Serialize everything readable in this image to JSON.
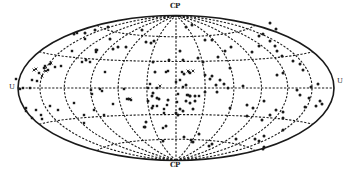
{
  "figure": {
    "projection": "Aitoff / Hammer equal-area all-sky projection",
    "labels": {
      "top": "CP",
      "bottom": "CP",
      "left": "U",
      "right": "U"
    },
    "geometry": {
      "cx": 176,
      "cy": 88,
      "rx": 158,
      "ry": 72.5
    },
    "colors": {
      "background": "#ffffff",
      "ink": "#1a1a1a"
    },
    "graticule": {
      "meridians_deg": [
        -150,
        -120,
        -90,
        -60,
        -30,
        0,
        30,
        60,
        90,
        120,
        150
      ],
      "parallels_deg": [
        -60,
        -30,
        0,
        30,
        60
      ],
      "style": "dashed"
    },
    "markers": {
      "dots": [
        [
          108,
          27
        ],
        [
          113,
          49
        ],
        [
          118,
          47
        ],
        [
          142,
          30
        ],
        [
          146,
          42
        ],
        [
          151,
          43
        ],
        [
          154,
          41
        ],
        [
          186,
          27
        ],
        [
          192,
          25
        ],
        [
          205,
          40
        ],
        [
          212,
          40
        ],
        [
          225,
          51
        ],
        [
          231,
          47
        ],
        [
          252,
          52
        ],
        [
          259,
          46
        ],
        [
          270,
          41
        ],
        [
          275,
          46
        ],
        [
          277,
          51
        ],
        [
          282,
          56
        ],
        [
          293,
          61
        ],
        [
          300,
          64
        ],
        [
          303,
          70
        ],
        [
          277,
          75
        ],
        [
          283,
          73
        ],
        [
          155,
          72
        ],
        [
          184,
          74
        ],
        [
          205,
          75
        ],
        [
          210,
          79
        ],
        [
          212,
          76
        ],
        [
          220,
          80
        ],
        [
          228,
          88
        ],
        [
          243,
          86
        ],
        [
          297,
          90
        ],
        [
          311,
          87
        ],
        [
          318,
          84
        ],
        [
          300,
          95
        ],
        [
          309,
          98
        ],
        [
          320,
          101
        ],
        [
          316,
          106
        ],
        [
          322,
          104
        ],
        [
          264,
          101
        ],
        [
          276,
          110
        ],
        [
          283,
          112
        ],
        [
          305,
          107
        ],
        [
          230,
          108
        ],
        [
          247,
          105
        ],
        [
          253,
          108
        ],
        [
          262,
          120
        ],
        [
          247,
          116
        ],
        [
          270,
          115
        ],
        [
          283,
          118
        ],
        [
          186,
          101
        ],
        [
          190,
          103
        ],
        [
          195,
          101
        ],
        [
          180,
          109
        ],
        [
          183,
          111
        ],
        [
          176,
          113
        ],
        [
          178,
          115
        ],
        [
          193,
          109
        ],
        [
          166,
          126
        ],
        [
          152,
          108
        ],
        [
          159,
          99
        ],
        [
          148,
          101
        ],
        [
          152,
          96
        ],
        [
          157,
          98
        ],
        [
          146,
          122
        ],
        [
          145,
          127
        ],
        [
          163,
          141
        ],
        [
          184,
          137
        ],
        [
          191,
          140
        ],
        [
          193,
          142
        ],
        [
          199,
          134
        ],
        [
          209,
          146
        ],
        [
          212,
          144
        ],
        [
          236,
          139
        ],
        [
          255,
          139
        ],
        [
          259,
          141
        ],
        [
          264,
          136
        ],
        [
          283,
          130
        ],
        [
          264,
          147
        ],
        [
          263,
          149
        ],
        [
          180,
          51
        ],
        [
          198,
          58
        ],
        [
          218,
          57
        ],
        [
          230,
          68
        ],
        [
          216,
          85
        ],
        [
          224,
          84
        ],
        [
          153,
          62
        ],
        [
          186,
          85
        ],
        [
          205,
          92
        ],
        [
          217,
          92
        ],
        [
          110,
          39
        ],
        [
          74,
          34
        ],
        [
          85,
          33
        ],
        [
          96,
          50
        ],
        [
          126,
          47
        ],
        [
          153,
          93
        ],
        [
          169,
          60
        ],
        [
          86,
          60
        ],
        [
          203,
          62
        ],
        [
          195,
          96
        ],
        [
          183,
          60
        ],
        [
          190,
          96
        ],
        [
          168,
          100
        ],
        [
          270,
          23
        ],
        [
          259,
          36
        ],
        [
          263,
          34
        ],
        [
          95,
          30
        ],
        [
          276,
          29
        ]
      ],
      "squares": [
        [
          16,
          79
        ],
        [
          23,
          88
        ],
        [
          30,
          88
        ],
        [
          32,
          80
        ],
        [
          37,
          81
        ],
        [
          39,
          73
        ],
        [
          44,
          68
        ],
        [
          45,
          66
        ],
        [
          48,
          70
        ],
        [
          50,
          64
        ],
        [
          55,
          67
        ],
        [
          61,
          66
        ],
        [
          72,
          51
        ],
        [
          77,
          33
        ],
        [
          85,
          39
        ],
        [
          90,
          62
        ],
        [
          82,
          62
        ],
        [
          96,
          52
        ],
        [
          97,
          50
        ],
        [
          105,
          72
        ],
        [
          100,
          89
        ],
        [
          102,
          91
        ],
        [
          91,
          90
        ],
        [
          92,
          94
        ],
        [
          127,
          99
        ],
        [
          129,
          99
        ],
        [
          131,
          100
        ],
        [
          124,
          89
        ],
        [
          148,
          88
        ],
        [
          157,
          88
        ],
        [
          150,
          84
        ],
        [
          166,
          72
        ],
        [
          168,
          71
        ],
        [
          182,
          72
        ],
        [
          189,
          72
        ],
        [
          190,
          73
        ],
        [
          176,
          82
        ],
        [
          180,
          80
        ],
        [
          183,
          87
        ],
        [
          187,
          95
        ],
        [
          190,
          96
        ],
        [
          36,
          110
        ],
        [
          26,
          108
        ],
        [
          32,
          118
        ],
        [
          41,
          115
        ],
        [
          50,
          106
        ],
        [
          58,
          110
        ],
        [
          74,
          103
        ],
        [
          84,
          115
        ],
        [
          94,
          110
        ],
        [
          84,
          123
        ],
        [
          104,
          115
        ],
        [
          113,
          104
        ],
        [
          144,
          127
        ],
        [
          163,
          128
        ],
        [
          177,
          102
        ],
        [
          178,
          94
        ],
        [
          188,
          95
        ],
        [
          199,
          96
        ],
        [
          153,
          106
        ],
        [
          157,
          106
        ],
        [
          164,
          109
        ],
        [
          167,
          105
        ],
        [
          164,
          113
        ],
        [
          20,
          89
        ],
        [
          26,
          111
        ],
        [
          42,
          119
        ]
      ],
      "crosses": [
        [
          34,
          70
        ],
        [
          36,
          69
        ],
        [
          42,
          76
        ],
        [
          46,
          71
        ],
        [
          51,
          63
        ],
        [
          130,
          99
        ],
        [
          188,
          71
        ],
        [
          193,
          71
        ],
        [
          160,
          86
        ]
      ]
    }
  }
}
